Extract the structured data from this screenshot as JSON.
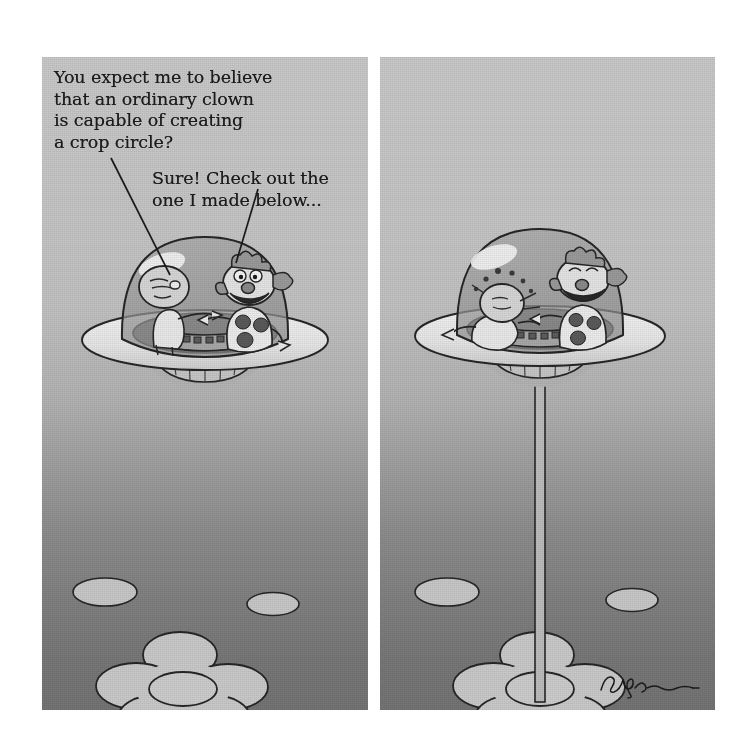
{
  "comic": {
    "title": "Flying saucer crop circle cartoon",
    "panel_count": 2,
    "background": {
      "top_color": "#c9c9c9",
      "bottom_color": "#747474",
      "sky_gradient": true,
      "texture": "halftone-dots"
    },
    "ink_color": "#1b1b1b",
    "highlight_color": "#f2f2f2"
  },
  "panels": [
    {
      "id": "panel-left",
      "name": "left-panel",
      "captions": [
        {
          "id": "caption-alien",
          "speaker": "alien",
          "text": "You expect me to believe\nthat an ordinary clown\nis capable of creating\na crop circle?",
          "pointer": "line-to-alien"
        },
        {
          "id": "caption-clown",
          "speaker": "clown",
          "text": "Sure! Check out the\none I made below...",
          "pointer": "line-to-clown"
        }
      ],
      "objects": [
        "flying-saucer",
        "glass-dome",
        "alien-pilot",
        "clown-passenger",
        "control-console",
        "flower-crop-circle",
        "small-crop-oval-left",
        "small-crop-oval-right"
      ]
    },
    {
      "id": "panel-right",
      "name": "right-panel",
      "captions": [],
      "objects": [
        "flying-saucer",
        "glass-dome",
        "alien-pilot-shocked",
        "clown-passenger-laughing",
        "control-console",
        "tractor-beam",
        "flower-crop-circle",
        "small-crop-oval-left",
        "small-crop-oval-right",
        "artist-signature"
      ]
    }
  ],
  "crop_circle": {
    "name": "flower-crop-circle",
    "petal_count": 5,
    "has_center": true,
    "fill_color": "#cfcfcf"
  },
  "signature": {
    "name": "artist-signature",
    "text": ""
  }
}
